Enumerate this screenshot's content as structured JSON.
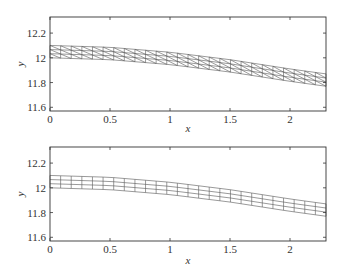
{
  "chart_data": [
    {
      "type": "line",
      "title": "",
      "subtitle": "triangular mesh (diagonal cells)",
      "xlabel": "x",
      "ylabel": "y",
      "xlim": [
        0,
        2.3
      ],
      "ylim": [
        11.57,
        12.33
      ],
      "xticks": [
        0,
        0.5,
        1,
        1.5,
        2
      ],
      "xtick_labels": [
        "0",
        "0.5",
        "1",
        "1.5",
        "2"
      ],
      "yticks": [
        11.6,
        11.8,
        12,
        12.2
      ],
      "ytick_labels": [
        "11.6",
        "11.8",
        "12",
        "12.2"
      ],
      "grid": false,
      "legend": null,
      "mesh": {
        "style": "triangles",
        "columns": 26,
        "layers": 3
      },
      "series": [
        {
          "name": "upper boundary",
          "x": [
            0,
            0.5,
            1,
            1.5,
            2,
            2.3
          ],
          "values": [
            12.1,
            12.085,
            12.045,
            11.985,
            11.91,
            11.87
          ]
        },
        {
          "name": "lower boundary",
          "x": [
            0,
            0.5,
            1,
            1.5,
            2,
            2.3
          ],
          "values": [
            12.0,
            11.985,
            11.945,
            11.885,
            11.81,
            11.77
          ]
        }
      ]
    },
    {
      "type": "line",
      "title": "",
      "subtitle": "quadrilateral mesh (rectangular cells)",
      "xlabel": "x",
      "ylabel": "y",
      "xlim": [
        0,
        2.3
      ],
      "ylim": [
        11.57,
        12.33
      ],
      "xticks": [
        0,
        0.5,
        1,
        1.5,
        2
      ],
      "xtick_labels": [
        "0",
        "0.5",
        "1",
        "1.5",
        "2"
      ],
      "yticks": [
        11.6,
        11.8,
        12,
        12.2
      ],
      "ytick_labels": [
        "11.6",
        "11.8",
        "12",
        "12.2"
      ],
      "grid": false,
      "legend": null,
      "mesh": {
        "style": "quads",
        "columns": 26,
        "layers": 3
      },
      "series": [
        {
          "name": "upper boundary",
          "x": [
            0,
            0.5,
            1,
            1.5,
            2,
            2.3
          ],
          "values": [
            12.1,
            12.085,
            12.045,
            11.985,
            11.91,
            11.87
          ]
        },
        {
          "name": "lower boundary",
          "x": [
            0,
            0.5,
            1,
            1.5,
            2,
            2.3
          ],
          "values": [
            12.0,
            11.985,
            11.945,
            11.885,
            11.81,
            11.77
          ]
        }
      ]
    }
  ],
  "style": {
    "frame_color": "#333333",
    "mesh_color": "#555555",
    "text_color": "#333333"
  }
}
